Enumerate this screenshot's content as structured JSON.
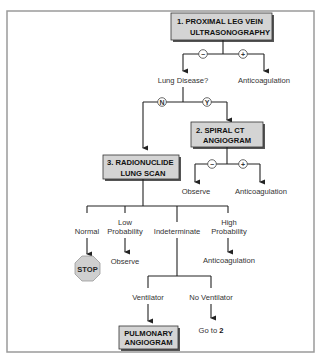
{
  "flowchart": {
    "boxes": {
      "ultrasonography": {
        "line1": "1.  PROXIMAL LEG VEIN",
        "line2": "ULTRASONOGRAPHY"
      },
      "spiral_ct": {
        "line1": "2.   SPIRAL CT",
        "line2": "ANGIOGRAM"
      },
      "lung_scan": {
        "line1": "3.  RADIONUCLIDE",
        "line2": "LUNG SCAN"
      },
      "pulmonary": {
        "line1": "PULMONARY",
        "line2": "ANGIOGRAM"
      }
    },
    "branch_markers": {
      "negative": "−",
      "positive": "+",
      "no": "N",
      "yes": "Y"
    },
    "labels": {
      "lung_disease": "Lung Disease?",
      "anticoagulation_1": "Anticoagulation",
      "observe_2": "Observe",
      "anticoagulation_2": "Anticoagulation",
      "normal": "Normal",
      "low_prob_line1": "Low",
      "low_prob_line2": "Probability",
      "indeterminate": "Indeterminate",
      "high_prob_line1": "High",
      "high_prob_line2": "Probability",
      "observe_3": "Observe",
      "anticoagulation_3": "Anticoagulation",
      "ventilator": "Ventilator",
      "no_ventilator": "No Ventilator",
      "go_to_prefix": "Go to ",
      "go_to_target": "2"
    },
    "stop_sign": "STOP",
    "colors": {
      "box_fill": "#d4d4d4",
      "box_shadow": "#555555",
      "line": "#222222",
      "frame": "#999999",
      "stop_fill": "#cfcfcf"
    }
  }
}
